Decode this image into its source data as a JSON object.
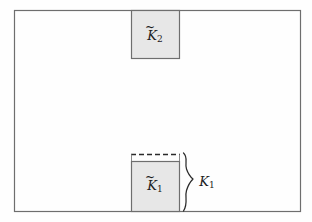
{
  "figure": {
    "type": "geometric-diagram",
    "background_color": "#fefefe",
    "outer_rectangle": {
      "name": "ambient-domain",
      "x": 14,
      "y": 10,
      "width": 286,
      "height": 201,
      "stroke": "#6e6e6e",
      "fill": "none"
    },
    "shaded_fill": "#e7e7e7",
    "shaded_stroke": "#6e6e6e",
    "boxes": [
      {
        "id": "k2",
        "label_base": "K",
        "label_subscript": "2",
        "accent": "tilde",
        "label_full": "K̃2",
        "x": 131,
        "y": 10,
        "width": 48,
        "height": 48,
        "attached_edge": "top",
        "has_dashed_edge": false
      },
      {
        "id": "k1",
        "label_base": "K",
        "label_subscript": "1",
        "accent": "tilde",
        "label_full": "K̃1",
        "x": 131,
        "y": 161,
        "width": 49,
        "height": 50,
        "attached_edge": "bottom",
        "has_dashed_edge": true,
        "dashed_edge_y": 154
      }
    ],
    "brace": {
      "id": "k1-extent-brace",
      "orientation": "right-facing",
      "top": 153,
      "bottom": 211,
      "x": 184,
      "label_base": "K",
      "label_subscript": "1",
      "accent": "none",
      "label_full": "K1",
      "label_x": 206,
      "label_y": 183,
      "stroke": "#2a2a2a"
    }
  }
}
